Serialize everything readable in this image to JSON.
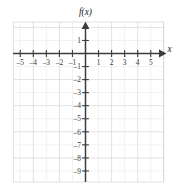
{
  "figure": {
    "kind": "blank-cartesian-grid",
    "background_color": "#ffffff",
    "axis_color": "#3c3c3c",
    "grid_color_minor": "#e9eaec",
    "grid_color_major": "#d4d6da",
    "y_axis_label": "f(x)",
    "x_axis_label": "x"
  },
  "chart_data": {
    "type": "scatter",
    "title": "",
    "subtitle": "",
    "xlabel": "x",
    "ylabel": "f(x)",
    "xlim": [
      -5.8,
      5.8
    ],
    "ylim": [
      -9.6,
      1.6
    ],
    "grid": true,
    "grid_step": 1,
    "grid_major_step": 2,
    "legend": "none",
    "series": [],
    "x_ticks": [
      -5,
      -4,
      -3,
      -2,
      -1,
      1,
      2,
      3,
      4,
      5
    ],
    "x_tick_labels": [
      "–5",
      "–4",
      "–3",
      "–2",
      "–1",
      "1",
      "2",
      "3",
      "4",
      "5"
    ],
    "y_ticks": [
      1,
      -1,
      -2,
      -3,
      -4,
      -5,
      -6,
      -7,
      -8,
      -9
    ],
    "y_tick_labels": [
      "1",
      "–1",
      "–2",
      "–3",
      "–4",
      "–5",
      "–6",
      "–7",
      "–8",
      "–9"
    ],
    "annotations": []
  },
  "labels": {
    "y_axis": "f(x)",
    "x_axis": "x",
    "x_ticks": [
      "–5",
      "–4",
      "–3",
      "–2",
      "–1",
      "1",
      "2",
      "3",
      "4",
      "5"
    ],
    "y_ticks": [
      "1",
      "–1",
      "–2",
      "–3",
      "–4",
      "–5",
      "–6",
      "–7",
      "–8",
      "–9"
    ]
  }
}
